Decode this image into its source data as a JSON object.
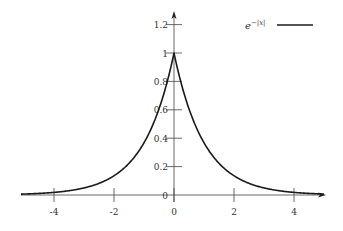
{
  "chart_data": {
    "type": "line",
    "title": "",
    "xlabel": "",
    "ylabel": "",
    "xlim": [
      -5.1,
      5
    ],
    "ylim": [
      0,
      1.3
    ],
    "grid": false,
    "legend_position": "top-right",
    "x_ticks": [
      -4,
      -2,
      0,
      2,
      4
    ],
    "x_tick_labels": [
      "-4",
      "-2",
      "0",
      "2",
      "4"
    ],
    "y_ticks": [
      0,
      0.2,
      0.4,
      0.6,
      0.8,
      1,
      1.2
    ],
    "y_tick_labels": [
      "0",
      "0.2",
      "0.4",
      "0.6",
      "0.8",
      "1",
      "1.2"
    ],
    "series": [
      {
        "name": "e^{-|x|}",
        "legend_label": "e",
        "legend_exponent": "−|x|",
        "color": "#1a1a1a",
        "function": "exp(-abs(x))",
        "x": [
          -5,
          -4,
          -3,
          -2,
          -1,
          -0.5,
          0,
          0.5,
          1,
          2,
          3,
          4,
          5
        ],
        "values": [
          0.0067,
          0.0183,
          0.0498,
          0.1353,
          0.3679,
          0.6065,
          1.0,
          0.6065,
          0.3679,
          0.1353,
          0.0498,
          0.0183,
          0.0067
        ]
      }
    ]
  }
}
